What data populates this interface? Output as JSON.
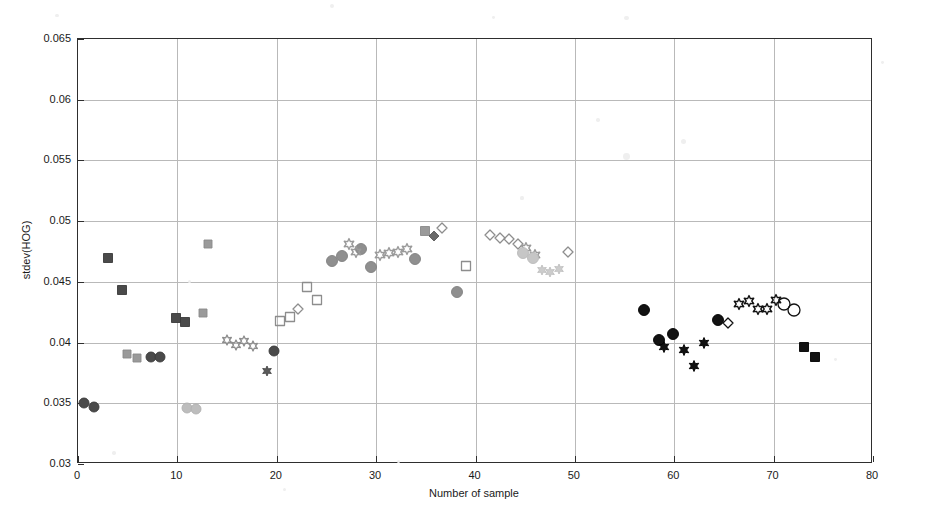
{
  "axes": {
    "xlabel": "Number of sample",
    "ylabel": "stdev(HOG)",
    "xticks": [
      "0",
      "10",
      "20",
      "30",
      "40",
      "50",
      "60",
      "70",
      "80"
    ],
    "yticks": [
      "0.03",
      "0.035",
      "0.04",
      "0.045",
      "0.05",
      "0.055",
      "0.06",
      "0.065"
    ],
    "xlim": [
      0,
      80
    ],
    "ylim": [
      0.03,
      0.065
    ]
  },
  "colors": {
    "axis": "#2e2e2e",
    "grid": "#b9b9b9",
    "black": "#121212",
    "dark_gray": "#4a4a4a",
    "mid_gray": "#7d7d7d",
    "light_gray": "#b0b0b0",
    "pale_gray": "#d2d2d2",
    "background": "#ffffff"
  },
  "chart_data": {
    "type": "scatter",
    "title": "",
    "xlabel": "Number of sample",
    "ylabel": "stdev(HOG)",
    "xlim": [
      0,
      80
    ],
    "ylim": [
      0.03,
      0.065
    ],
    "grid": true,
    "legend": "none",
    "series": [
      {
        "name": "dark-square",
        "marker": "square",
        "fill": "#4a4a4a",
        "edge": "#3a3a3a",
        "size": 9,
        "points": [
          {
            "x": 3.0,
            "y": 0.047
          },
          {
            "x": 4.4,
            "y": 0.0443
          },
          {
            "x": 9.9,
            "y": 0.042
          },
          {
            "x": 10.8,
            "y": 0.0417
          }
        ]
      },
      {
        "name": "dark-circle",
        "marker": "circle",
        "fill": "#4a4a4a",
        "edge": "#3a3a3a",
        "size": 10,
        "points": [
          {
            "x": 0.6,
            "y": 0.035
          },
          {
            "x": 1.6,
            "y": 0.0347
          },
          {
            "x": 7.3,
            "y": 0.0388
          },
          {
            "x": 8.3,
            "y": 0.0388
          },
          {
            "x": 19.7,
            "y": 0.0393
          }
        ]
      },
      {
        "name": "mid-gray-square",
        "marker": "square",
        "fill": "#9a9a9a",
        "edge": "#8a8a8a",
        "size": 8,
        "points": [
          {
            "x": 4.9,
            "y": 0.0391
          },
          {
            "x": 5.9,
            "y": 0.0387
          },
          {
            "x": 12.6,
            "y": 0.0424
          },
          {
            "x": 13.1,
            "y": 0.0481
          }
        ]
      },
      {
        "name": "light-gray-circle-low",
        "marker": "circle",
        "fill": "#bdbdbd",
        "edge": "#b0b0b0",
        "size": 10,
        "points": [
          {
            "x": 11.0,
            "y": 0.0346
          },
          {
            "x": 11.9,
            "y": 0.0345
          }
        ]
      },
      {
        "name": "gray-open-star",
        "marker": "hexstar-open",
        "fill": "none",
        "edge": "#8d8d8d",
        "size": 10,
        "points": [
          {
            "x": 15.0,
            "y": 0.0402
          },
          {
            "x": 15.9,
            "y": 0.0398
          },
          {
            "x": 16.7,
            "y": 0.0401
          },
          {
            "x": 17.6,
            "y": 0.0397
          }
        ]
      },
      {
        "name": "gray-asterisk",
        "marker": "hexstar-filled",
        "fill": "#5a5a5a",
        "edge": "#4a4a4a",
        "size": 10,
        "points": [
          {
            "x": 19.0,
            "y": 0.0377
          }
        ]
      },
      {
        "name": "open-square",
        "marker": "square-open",
        "fill": "none",
        "edge": "#8d8d8d",
        "size": 9,
        "points": [
          {
            "x": 20.3,
            "y": 0.0418
          },
          {
            "x": 21.3,
            "y": 0.0421
          },
          {
            "x": 23.0,
            "y": 0.0446
          },
          {
            "x": 24.0,
            "y": 0.0435
          },
          {
            "x": 39.0,
            "y": 0.0463
          }
        ]
      },
      {
        "name": "open-diamond",
        "marker": "diamond-open",
        "fill": "none",
        "edge": "#8d8d8d",
        "size": 10,
        "points": [
          {
            "x": 22.1,
            "y": 0.0428
          },
          {
            "x": 36.6,
            "y": 0.0494
          },
          {
            "x": 41.5,
            "y": 0.0489
          },
          {
            "x": 42.5,
            "y": 0.0486
          },
          {
            "x": 43.4,
            "y": 0.0485
          },
          {
            "x": 44.3,
            "y": 0.0481
          },
          {
            "x": 49.3,
            "y": 0.0475
          }
        ]
      },
      {
        "name": "mid-gray-circle",
        "marker": "circle",
        "fill": "#8f8f8f",
        "edge": "#808080",
        "size": 11,
        "points": [
          {
            "x": 25.6,
            "y": 0.0467
          },
          {
            "x": 26.6,
            "y": 0.0471
          },
          {
            "x": 28.5,
            "y": 0.0477
          },
          {
            "x": 29.5,
            "y": 0.0462
          },
          {
            "x": 33.9,
            "y": 0.0469
          },
          {
            "x": 38.1,
            "y": 0.0442
          }
        ]
      },
      {
        "name": "gray-open-star-mid",
        "marker": "hexstar-open",
        "fill": "none",
        "edge": "#9a9a9a",
        "size": 11,
        "points": [
          {
            "x": 27.3,
            "y": 0.0481
          },
          {
            "x": 28.0,
            "y": 0.0475
          },
          {
            "x": 30.4,
            "y": 0.0472
          },
          {
            "x": 31.3,
            "y": 0.0474
          },
          {
            "x": 32.2,
            "y": 0.0475
          },
          {
            "x": 33.1,
            "y": 0.0477
          },
          {
            "x": 45.1,
            "y": 0.0478
          },
          {
            "x": 46.0,
            "y": 0.0472
          }
        ]
      },
      {
        "name": "gray-square-mid",
        "marker": "square",
        "fill": "#9a9a9a",
        "edge": "#8a8a8a",
        "size": 9,
        "points": [
          {
            "x": 34.9,
            "y": 0.0492
          }
        ]
      },
      {
        "name": "gray-diamond-filled",
        "marker": "diamond",
        "fill": "#6a6a6a",
        "edge": "#5a5a5a",
        "size": 10,
        "points": [
          {
            "x": 35.8,
            "y": 0.0488
          }
        ]
      },
      {
        "name": "pale-gray-circle",
        "marker": "circle",
        "fill": "#c6c6c6",
        "edge": "#bababa",
        "size": 11,
        "points": [
          {
            "x": 44.8,
            "y": 0.0474
          },
          {
            "x": 45.8,
            "y": 0.047
          }
        ]
      },
      {
        "name": "pale-gray-star",
        "marker": "hexstar-filled",
        "fill": "#cccccc",
        "edge": "#c0c0c0",
        "size": 10,
        "points": [
          {
            "x": 46.7,
            "y": 0.046
          },
          {
            "x": 47.5,
            "y": 0.0458
          },
          {
            "x": 48.4,
            "y": 0.0461
          }
        ]
      },
      {
        "name": "black-circle",
        "marker": "circle",
        "fill": "#121212",
        "edge": "#000000",
        "size": 11,
        "points": [
          {
            "x": 57.0,
            "y": 0.0427
          },
          {
            "x": 58.5,
            "y": 0.0402
          },
          {
            "x": 59.9,
            "y": 0.0407
          },
          {
            "x": 64.4,
            "y": 0.0419
          }
        ]
      },
      {
        "name": "black-hexstar",
        "marker": "hexstar-filled",
        "fill": "#121212",
        "edge": "#000000",
        "size": 11,
        "points": [
          {
            "x": 59.0,
            "y": 0.0396
          },
          {
            "x": 61.0,
            "y": 0.0394
          },
          {
            "x": 62.0,
            "y": 0.0381
          },
          {
            "x": 63.0,
            "y": 0.04
          }
        ]
      },
      {
        "name": "black-open-diamond",
        "marker": "diamond-open",
        "fill": "none",
        "edge": "#121212",
        "size": 10,
        "points": [
          {
            "x": 65.4,
            "y": 0.0416
          }
        ]
      },
      {
        "name": "black-open-star",
        "marker": "hexstar-open",
        "fill": "none",
        "edge": "#121212",
        "size": 11,
        "points": [
          {
            "x": 66.5,
            "y": 0.0432
          },
          {
            "x": 67.5,
            "y": 0.0434
          },
          {
            "x": 68.4,
            "y": 0.0428
          },
          {
            "x": 69.3,
            "y": 0.0428
          },
          {
            "x": 70.2,
            "y": 0.0435
          }
        ]
      },
      {
        "name": "black-open-circle",
        "marker": "circle-open",
        "fill": "none",
        "edge": "#121212",
        "size": 12,
        "points": [
          {
            "x": 71.0,
            "y": 0.0432
          },
          {
            "x": 72.1,
            "y": 0.0427
          }
        ]
      },
      {
        "name": "black-square",
        "marker": "square",
        "fill": "#121212",
        "edge": "#000000",
        "size": 9,
        "points": [
          {
            "x": 73.1,
            "y": 0.0396
          },
          {
            "x": 74.2,
            "y": 0.0388
          }
        ]
      }
    ]
  },
  "specks": [
    {
      "x": 0.35,
      "y": 0.012,
      "r": 2.0
    },
    {
      "x": 0.06,
      "y": 0.03,
      "r": 1.6
    },
    {
      "x": 0.52,
      "y": 0.034,
      "r": 1.4
    },
    {
      "x": 0.66,
      "y": 0.035,
      "r": 2.2
    },
    {
      "x": 0.72,
      "y": 0.272,
      "r": 2.6
    },
    {
      "x": 0.66,
      "y": 0.3,
      "r": 3.4
    },
    {
      "x": 0.63,
      "y": 0.23,
      "r": 1.8
    },
    {
      "x": 0.55,
      "y": 0.38,
      "r": 1.6
    },
    {
      "x": 0.93,
      "y": 0.12,
      "r": 1.4
    },
    {
      "x": 0.2,
      "y": 0.54,
      "r": 1.6
    },
    {
      "x": 0.12,
      "y": 0.87,
      "r": 1.8
    },
    {
      "x": 0.3,
      "y": 0.94,
      "r": 1.5
    },
    {
      "x": 0.88,
      "y": 0.69,
      "r": 1.4
    },
    {
      "x": 0.42,
      "y": 0.885,
      "r": 1.5
    }
  ]
}
